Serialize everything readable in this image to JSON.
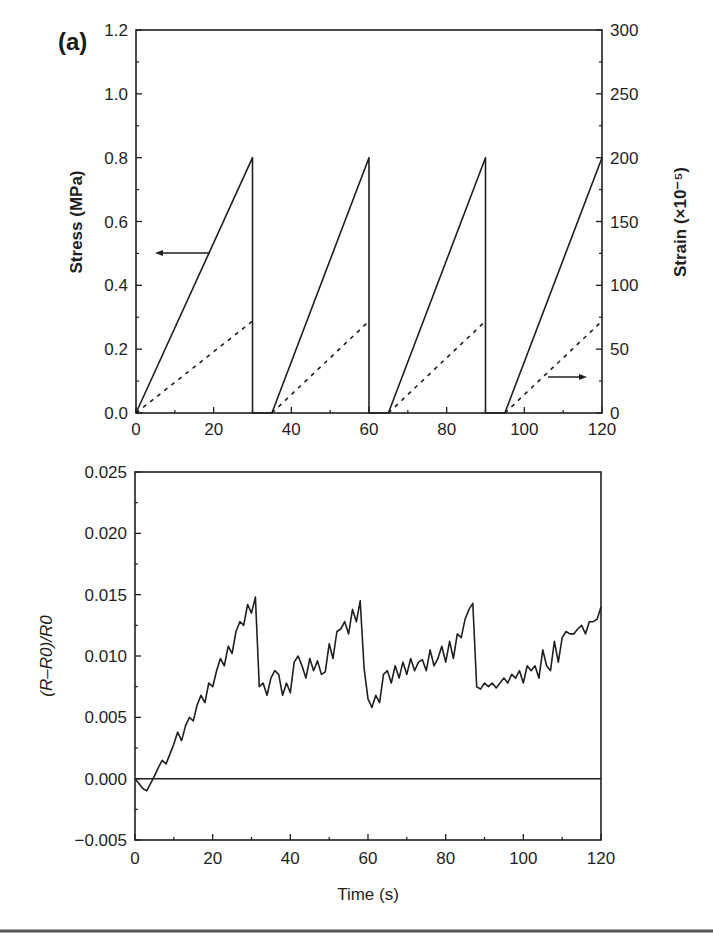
{
  "panel_label": "(a)",
  "colors": {
    "line": "#1f1f1f",
    "background": "#ffffff"
  },
  "chart_data": [
    {
      "type": "line",
      "title": "",
      "xlabel": "",
      "ylabel": "Stress (MPa)",
      "y2label": "Strain (×10⁻⁵)",
      "xlim": [
        0,
        120
      ],
      "ylim": [
        0,
        1.2
      ],
      "y2lim": [
        0,
        300
      ],
      "xticks": [
        "0",
        "20",
        "40",
        "60",
        "80",
        "100",
        "120"
      ],
      "yticks": [
        "0.0",
        "0.2",
        "0.4",
        "0.6",
        "0.8",
        "1.0",
        "1.2"
      ],
      "y2ticks": [
        "0",
        "50",
        "100",
        "150",
        "200",
        "250",
        "300"
      ],
      "grid": false,
      "annotations": [
        "arrow pointing left to Stress axis (solid line)",
        "arrow pointing right to Strain axis (dashed line)"
      ],
      "series": [
        {
          "name": "Stress",
          "axis": "left",
          "style": "solid",
          "x": [
            0,
            30,
            30,
            35,
            60,
            60,
            65,
            90,
            90,
            95,
            120
          ],
          "values": [
            0,
            0.8,
            0,
            0,
            0.8,
            0,
            0,
            0.8,
            0,
            0,
            0.8
          ]
        },
        {
          "name": "Strain",
          "axis": "right",
          "style": "dashed",
          "x": [
            0,
            30,
            35,
            60,
            65,
            90,
            95,
            120
          ],
          "values": [
            0,
            72,
            0,
            72,
            0,
            72,
            0,
            72
          ]
        }
      ]
    },
    {
      "type": "line",
      "title": "",
      "xlabel": "Time (s)",
      "ylabel": "(R–R0)/R0",
      "xlim": [
        0,
        120
      ],
      "ylim": [
        -0.005,
        0.025
      ],
      "xticks": [
        "0",
        "20",
        "40",
        "60",
        "80",
        "100",
        "120"
      ],
      "yticks": [
        "−0.005",
        "0.000",
        "0.005",
        "0.010",
        "0.015",
        "0.020",
        "0.025"
      ],
      "grid": false,
      "series": [
        {
          "name": "Fractional resistance change",
          "x": [
            0,
            1,
            2,
            3,
            4,
            5,
            6,
            7,
            8,
            9,
            10,
            11,
            12,
            13,
            14,
            15,
            16,
            17,
            18,
            19,
            20,
            21,
            22,
            23,
            24,
            25,
            26,
            27,
            28,
            29,
            30,
            31,
            32,
            33,
            34,
            35,
            36,
            37,
            38,
            39,
            40,
            41,
            42,
            43,
            44,
            45,
            46,
            47,
            48,
            49,
            50,
            51,
            52,
            53,
            54,
            55,
            56,
            57,
            58,
            59,
            60,
            61,
            62,
            63,
            64,
            65,
            66,
            67,
            68,
            69,
            70,
            71,
            72,
            73,
            74,
            75,
            76,
            77,
            78,
            79,
            80,
            81,
            82,
            83,
            84,
            85,
            86,
            87,
            88,
            89,
            90,
            91,
            92,
            93,
            94,
            95,
            96,
            97,
            98,
            99,
            100,
            101,
            102,
            103,
            104,
            105,
            106,
            107,
            108,
            109,
            110,
            111,
            112,
            113,
            114,
            115,
            116,
            117,
            118,
            119,
            120
          ],
          "values": [
            0.0,
            -0.0004,
            -0.0008,
            -0.001,
            -0.0004,
            0.0002,
            0.0009,
            0.0015,
            0.0012,
            0.002,
            0.0028,
            0.0038,
            0.0031,
            0.0043,
            0.005,
            0.0047,
            0.006,
            0.0068,
            0.0062,
            0.0078,
            0.0075,
            0.0088,
            0.0098,
            0.0092,
            0.0108,
            0.0102,
            0.012,
            0.0128,
            0.0125,
            0.0142,
            0.0135,
            0.0148,
            0.0075,
            0.0078,
            0.0068,
            0.0082,
            0.0088,
            0.0085,
            0.0068,
            0.0078,
            0.007,
            0.0095,
            0.01,
            0.0092,
            0.0082,
            0.0098,
            0.0088,
            0.0096,
            0.0085,
            0.0087,
            0.011,
            0.0098,
            0.012,
            0.0122,
            0.0128,
            0.0118,
            0.0138,
            0.0128,
            0.0145,
            0.009,
            0.0065,
            0.0058,
            0.0068,
            0.0062,
            0.0085,
            0.0088,
            0.0078,
            0.0092,
            0.0082,
            0.0095,
            0.0085,
            0.0098,
            0.0088,
            0.0095,
            0.0097,
            0.0088,
            0.0105,
            0.0092,
            0.0098,
            0.0108,
            0.0095,
            0.0112,
            0.0098,
            0.0118,
            0.0115,
            0.013,
            0.0138,
            0.0143,
            0.0075,
            0.0073,
            0.0078,
            0.0075,
            0.0078,
            0.0074,
            0.0078,
            0.0082,
            0.0078,
            0.0085,
            0.0082,
            0.0088,
            0.0078,
            0.0092,
            0.0088,
            0.0092,
            0.0082,
            0.0105,
            0.0092,
            0.0088,
            0.0112,
            0.0095,
            0.0115,
            0.012,
            0.0118,
            0.0118,
            0.0122,
            0.0125,
            0.0118,
            0.0128,
            0.0128,
            0.013,
            0.014
          ]
        },
        {
          "name": "Zero baseline",
          "x": [
            0,
            120
          ],
          "values": [
            0,
            0
          ]
        }
      ]
    }
  ]
}
